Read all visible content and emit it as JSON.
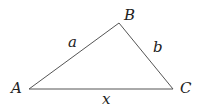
{
  "diagram": {
    "type": "triangle",
    "vertices": [
      {
        "name": "A",
        "x": 29,
        "y": 89
      },
      {
        "name": "B",
        "x": 119,
        "y": 23
      },
      {
        "name": "C",
        "x": 173,
        "y": 89
      }
    ],
    "vertex_labels": {
      "A": "A",
      "B": "B",
      "C": "C"
    },
    "side_labels": {
      "AB": "a",
      "BC": "b",
      "AC": "x"
    },
    "stroke_color": "#555555"
  }
}
